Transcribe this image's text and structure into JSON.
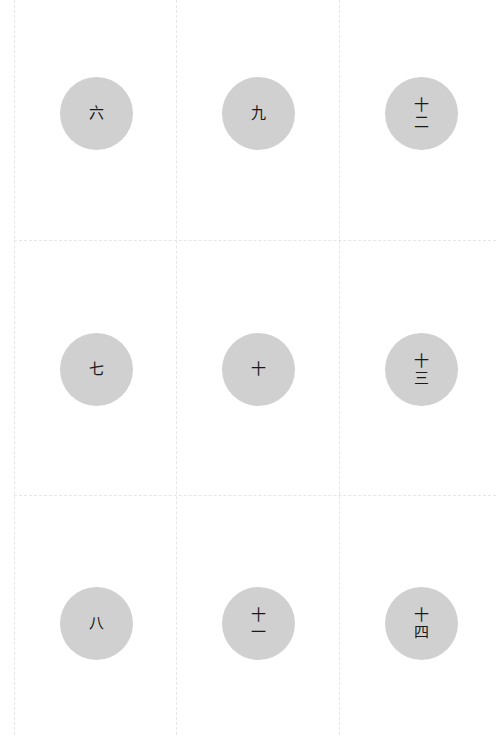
{
  "grid": {
    "columns": 3,
    "rows": 3,
    "line_color": "#e6e6e6",
    "disc_color": "#d0d0d0",
    "text_color": "#1a1a1a"
  },
  "cells": [
    {
      "label": "六",
      "chars": [
        "六"
      ]
    },
    {
      "label": "九",
      "chars": [
        "九"
      ]
    },
    {
      "label": "十二",
      "chars": [
        "十",
        "二"
      ]
    },
    {
      "label": "七",
      "chars": [
        "七"
      ]
    },
    {
      "label": "十",
      "chars": [
        "十"
      ]
    },
    {
      "label": "十三",
      "chars": [
        "十",
        "三"
      ]
    },
    {
      "label": "八",
      "chars": [
        "八"
      ]
    },
    {
      "label": "十一",
      "chars": [
        "十",
        "一"
      ]
    },
    {
      "label": "十四",
      "chars": [
        "十",
        "四"
      ]
    }
  ]
}
